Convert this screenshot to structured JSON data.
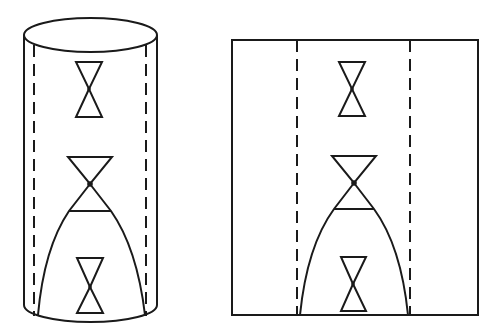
{
  "figure": {
    "stroke_color": "#1a1a1a",
    "background": "#ffffff",
    "panels": [
      {
        "id": "cylinder",
        "shape": "cylinder",
        "outline": {
          "left_x": 24,
          "right_x": 157,
          "top_cy": 35,
          "ry": 17,
          "bottom_y": 305
        },
        "dashed_lines_x": [
          34,
          146
        ],
        "light_cones": [
          {
            "name": "upper",
            "cx": 89,
            "top_y": 62,
            "vertex_y": 89,
            "bottom_y": 117,
            "half_width": 13
          },
          {
            "name": "middle",
            "cx": 90,
            "top_y": 157,
            "vertex_y": 184,
            "bottom_y": 211,
            "half_width": 22
          },
          {
            "name": "lower",
            "cx": 90,
            "top_y": 258,
            "vertex_y": 287,
            "bottom_y": 313,
            "half_width": 13
          }
        ],
        "horizon_curve": {
          "apex": [
            90,
            184
          ],
          "left_end": [
            38,
            315
          ],
          "right_end": [
            145,
            315
          ]
        }
      },
      {
        "id": "unrolled-strip",
        "shape": "rectangle",
        "outline": {
          "x": 232,
          "y": 40,
          "width": 246,
          "height": 275
        },
        "dashed_lines_x": [
          297,
          410
        ],
        "light_cones": [
          {
            "name": "upper",
            "cx": 352,
            "top_y": 62,
            "vertex_y": 89,
            "bottom_y": 116,
            "half_width": 13
          },
          {
            "name": "middle",
            "cx": 354,
            "top_y": 156,
            "vertex_y": 183,
            "bottom_y": 209,
            "half_width": 22
          },
          {
            "name": "lower",
            "cx": 353,
            "top_y": 257,
            "vertex_y": 284,
            "bottom_y": 311,
            "half_width": 13
          }
        ],
        "horizon_curve": {
          "apex": [
            354,
            183
          ],
          "left_end": [
            300,
            315
          ],
          "right_end": [
            408,
            315
          ]
        }
      }
    ]
  }
}
